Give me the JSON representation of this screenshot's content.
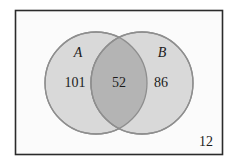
{
  "figure": {
    "kind": "venn-diagram",
    "universe": {
      "label": "",
      "outside_count": "12",
      "border_color": "#2b2b2b",
      "fill_color": "#fbfbfb"
    },
    "sets": [
      {
        "name": "set-a",
        "label": "A",
        "only_count": "101",
        "fill_color": "#d9d9d9",
        "stroke_color": "#8e8e8e"
      },
      {
        "name": "set-b",
        "label": "B",
        "only_count": "86",
        "fill_color": "#d9d9d9",
        "stroke_color": "#8e8e8e"
      }
    ],
    "intersection": {
      "name": "set-a-and-b",
      "count": "52",
      "fill_color": "#b4b4b4",
      "stroke_color": "#8e8e8e"
    }
  }
}
